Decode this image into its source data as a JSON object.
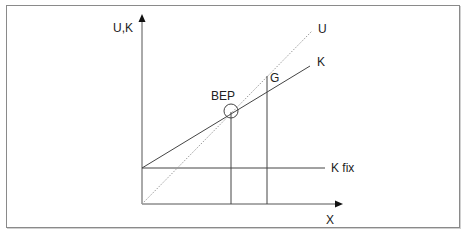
{
  "diagram": {
    "type": "break-even diagram",
    "axes": {
      "y_label": "U,K",
      "x_label": "X"
    },
    "lines": [
      {
        "id": "U",
        "label": "U",
        "style": "dotted",
        "description": "revenue line from origin"
      },
      {
        "id": "K",
        "label": "K",
        "style": "solid",
        "description": "total cost line starting at fixed cost"
      },
      {
        "id": "Kfix",
        "label": "K fix",
        "style": "solid",
        "description": "horizontal fixed cost line"
      }
    ],
    "points": [
      {
        "id": "BEP",
        "label": "BEP",
        "marker": "circle"
      },
      {
        "id": "G",
        "label": "G",
        "marker": "vertical-line"
      }
    ],
    "colors": {
      "line": "#333333",
      "dotted": "#9a9a9a",
      "frame": "#8a8a8a"
    }
  }
}
